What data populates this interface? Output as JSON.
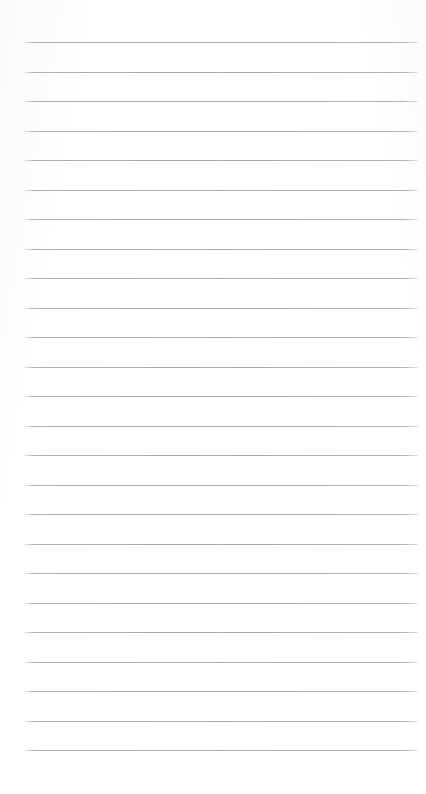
{
  "document": {
    "kind": "lined-paper",
    "title": "",
    "body_text": "",
    "is_blank": true
  },
  "page": {
    "width": 426,
    "height": 794,
    "background_color": "#ffffff"
  },
  "ruling": {
    "line_color": "#aeaeb2",
    "line_thickness_px": 1,
    "line_count": 25,
    "left_x": 25,
    "right_x": 418,
    "first_line_y": 42,
    "line_spacing_px": 29.5,
    "lines_y": [
      42,
      71.5,
      101,
      130.5,
      160,
      189.5,
      219,
      248.5,
      278,
      307.5,
      337,
      366.5,
      396,
      425.5,
      455,
      484.5,
      514,
      543.5,
      573,
      602.5,
      632,
      661.5,
      691,
      720.5,
      750
    ]
  },
  "content": {
    "lines_text": [
      "",
      "",
      "",
      "",
      "",
      "",
      "",
      "",
      "",
      "",
      "",
      "",
      "",
      "",
      "",
      "",
      "",
      "",
      "",
      "",
      "",
      "",
      "",
      "",
      ""
    ]
  }
}
